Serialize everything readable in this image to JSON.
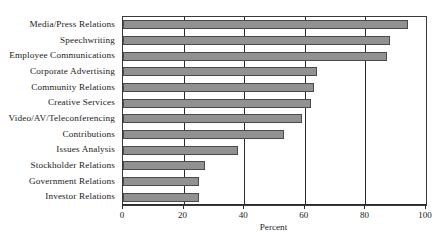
{
  "chart_data": {
    "type": "bar",
    "orientation": "horizontal",
    "title": "",
    "xlabel": "Percent",
    "ylabel": "",
    "xlim": [
      0,
      100
    ],
    "xticks": [
      0,
      20,
      40,
      60,
      80,
      100
    ],
    "grid": true,
    "legend": false,
    "bar_color": "#919191",
    "bar_border_color": "#4b4b4b",
    "axis_color": "#2b2b2b",
    "categories": [
      "Media/Press Relations",
      "Speechwriting",
      "Employee Communications",
      "Corporate Advertising",
      "Community Relations",
      "Creative Services",
      "Video/AV/Teleconferencing",
      "Contributions",
      "Issues Analysis",
      "Stockholder Relations",
      "Government Relations",
      "Investor Relations"
    ],
    "values": [
      94,
      88,
      87,
      64,
      63,
      62,
      59,
      53,
      38,
      27,
      25,
      25
    ]
  },
  "axis": {
    "tick_labels": [
      "0",
      "20",
      "40",
      "60",
      "80",
      "100"
    ],
    "title": "Percent"
  }
}
